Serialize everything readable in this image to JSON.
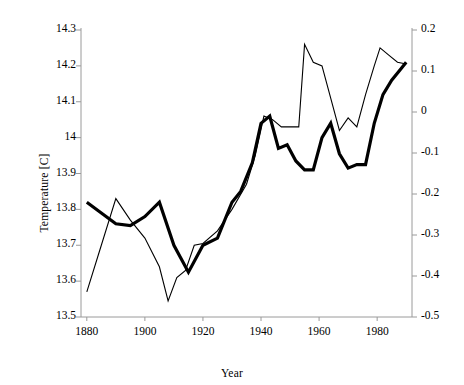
{
  "chart_data": {
    "type": "line",
    "title": "",
    "xlabel": "Year",
    "ylabel": "Temperature [C]",
    "xlim": [
      1878,
      1992
    ],
    "ylim": [
      13.5,
      14.3
    ],
    "y2lim": [
      -0.5,
      0.2
    ],
    "xticks": [
      1880,
      1900,
      1920,
      1940,
      1960,
      1980
    ],
    "yticks": [
      13.5,
      13.6,
      13.7,
      13.8,
      13.9,
      14,
      14.1,
      14.2,
      14.3
    ],
    "y2ticks": [
      -0.5,
      -0.4,
      -0.3,
      -0.2,
      -0.1,
      0,
      0.1,
      0.2
    ],
    "grid": false,
    "legend": "none",
    "series": [
      {
        "name": "thick-series",
        "style": "thick",
        "width": 3.2,
        "color": "#000000",
        "x": [
          1880,
          1885,
          1890,
          1895,
          1900,
          1905,
          1910,
          1915,
          1920,
          1925,
          1930,
          1933,
          1937,
          1940,
          1943,
          1946,
          1949,
          1952,
          1955,
          1958,
          1961,
          1964,
          1967,
          1970,
          1973,
          1976,
          1979,
          1982,
          1985,
          1988,
          1990
        ],
        "y": [
          13.82,
          13.79,
          13.76,
          13.755,
          13.78,
          13.82,
          13.7,
          13.625,
          13.7,
          13.72,
          13.82,
          13.85,
          13.93,
          14.04,
          14.06,
          13.97,
          13.98,
          13.935,
          13.91,
          13.91,
          14.0,
          14.04,
          13.955,
          13.915,
          13.925,
          13.925,
          14.04,
          14.12,
          14.16,
          14.19,
          14.21
        ]
      },
      {
        "name": "thin-series",
        "style": "thin",
        "width": 1.1,
        "color": "#000000",
        "x": [
          1880,
          1885,
          1890,
          1895,
          1900,
          1905,
          1908,
          1911,
          1914,
          1917,
          1920,
          1925,
          1930,
          1935,
          1938,
          1941,
          1944,
          1947,
          1950,
          1953,
          1955,
          1958,
          1961,
          1964,
          1967,
          1970,
          1973,
          1976,
          1979,
          1981,
          1984,
          1987,
          1990
        ],
        "y": [
          13.57,
          13.7,
          13.83,
          13.77,
          13.72,
          13.64,
          13.545,
          13.61,
          13.63,
          13.7,
          13.705,
          13.74,
          13.8,
          13.87,
          13.95,
          14.06,
          14.05,
          14.03,
          14.03,
          14.03,
          14.26,
          14.21,
          14.2,
          14.11,
          14.02,
          14.055,
          14.03,
          14.12,
          14.2,
          14.25,
          14.23,
          14.21,
          14.205
        ]
      }
    ]
  },
  "axes": {
    "x_tick_labels": [
      "1880",
      "1900",
      "1920",
      "1940",
      "1960",
      "1980"
    ],
    "y_left_tick_labels": [
      "14.3",
      "14.2",
      "14.1",
      "14",
      "13.9",
      "13.8",
      "13.7",
      "13.6",
      "13.5"
    ],
    "y_right_tick_labels": [
      "0.2",
      "0.1",
      "0",
      "-0.1",
      "-0.2",
      "-0.3",
      "-0.4",
      "-0.5"
    ],
    "x_title": "Year",
    "y_title": "Temperature [C]",
    "axis_color": "#9a9a9a"
  }
}
